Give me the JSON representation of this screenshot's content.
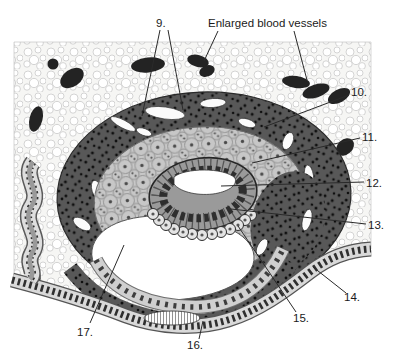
{
  "figure": {
    "top_label": "Enlarged blood vessels",
    "callouts": [
      {
        "id": "9",
        "text": "9."
      },
      {
        "id": "10",
        "text": "10."
      },
      {
        "id": "11",
        "text": "11."
      },
      {
        "id": "12",
        "text": "12."
      },
      {
        "id": "13",
        "text": "13."
      },
      {
        "id": "14",
        "text": "14."
      },
      {
        "id": "15",
        "text": "15."
      },
      {
        "id": "16",
        "text": "16."
      },
      {
        "id": "17",
        "text": "17."
      }
    ],
    "colors": {
      "page_background": "#ffffff",
      "stroma_background": "#f6f6f4",
      "stroma_bubble_outline": "#c9c9c9",
      "blood_vessel": "#232323",
      "syncytiotrophoblast": "#585858",
      "cytotrophoblast": "#c7c7c7",
      "epiblast": "#9a9a9a",
      "hypoblast": "#e4e4e4",
      "uterine_epithelium": "#d9d9d9",
      "cavity_white": "#ffffff",
      "annotation": "#1a1a1a"
    }
  }
}
